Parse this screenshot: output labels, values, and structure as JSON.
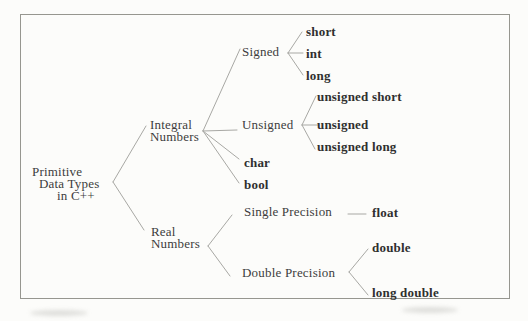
{
  "figure": {
    "background": "#fcfcfa",
    "border_color": "#96968f",
    "line_color": "#a8a8a4",
    "text_color": "#3d3d3d"
  },
  "tree": {
    "root": {
      "label_lines": [
        "Primitive",
        "Data Types",
        "in C++"
      ],
      "children": [
        {
          "label_lines": [
            "Integral",
            "Numbers"
          ],
          "children": [
            {
              "label": "Signed",
              "children": [
                {
                  "label": "short"
                },
                {
                  "label": "int"
                },
                {
                  "label": "long"
                }
              ]
            },
            {
              "label": "Unsigned",
              "children": [
                {
                  "label": "unsigned short"
                },
                {
                  "label": "unsigned"
                },
                {
                  "label": "unsigned long"
                }
              ]
            },
            {
              "label": "char"
            },
            {
              "label": "bool"
            }
          ]
        },
        {
          "label_lines": [
            "Real",
            "Numbers"
          ],
          "children": [
            {
              "label": "Single Precision",
              "children": [
                {
                  "label": "float"
                }
              ]
            },
            {
              "label": "Double Precision",
              "children": [
                {
                  "label": "double"
                },
                {
                  "label": "long double"
                }
              ]
            }
          ]
        }
      ]
    }
  }
}
